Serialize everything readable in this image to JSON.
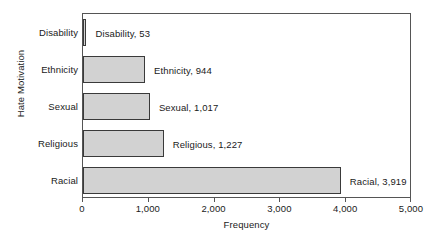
{
  "chart_data": {
    "type": "bar",
    "orientation": "horizontal",
    "title": "",
    "xlabel": "Frequency",
    "ylabel": "Hate Motivation",
    "categories": [
      "Disability",
      "Ethnicity",
      "Sexual",
      "Religious",
      "Racial"
    ],
    "values": [
      53,
      944,
      1017,
      1227,
      3919
    ],
    "point_labels": [
      "Disability, 53",
      "Ethnicity, 944",
      "Sexual, 1,017",
      "Religious, 1,227",
      "Racial, 3,919"
    ],
    "xlim": [
      0,
      5000
    ],
    "xticks": [
      0,
      1000,
      2000,
      3000,
      4000,
      5000
    ],
    "xtick_labels": [
      "0",
      "1,000",
      "2,000",
      "3,000",
      "4,000",
      "5,000"
    ],
    "grid": false,
    "legend": false,
    "bar_fill_color": "#d2d2d2",
    "bar_border_color": "#3a3a3a",
    "frame_color": "#555555",
    "background_color": "#ffffff",
    "text_color": "#1a1a1a"
  }
}
